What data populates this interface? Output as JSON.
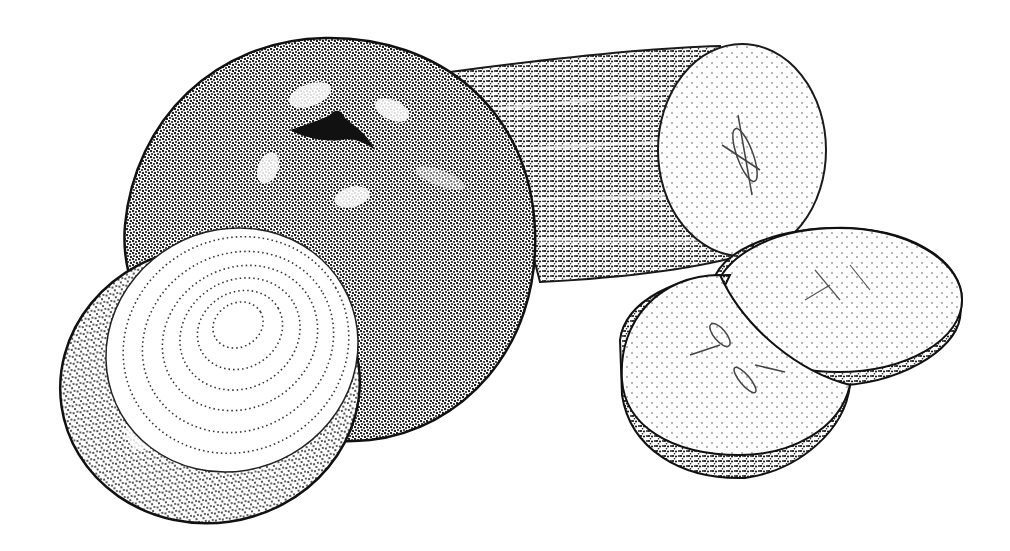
{
  "image": {
    "kind": "stippled pen-and-ink illustration",
    "background": "#ffffff",
    "ink": "#1a1a1a",
    "subjects": [
      "tomato",
      "onion-half",
      "cucumber",
      "cucumber-slice",
      "cucumber-slice"
    ]
  },
  "objects": {
    "tomato": {
      "cx": 330,
      "cy": 245,
      "rx": 205,
      "ry": 195
    },
    "cucumber_body": {
      "x": 450,
      "y": 50,
      "w": 300,
      "h": 235
    },
    "cucumber_end": {
      "cx": 742,
      "cy": 150,
      "rx": 84,
      "ry": 106
    },
    "onion_outer": {
      "cx": 210,
      "cy": 385,
      "rx": 155,
      "ry": 140
    },
    "onion_face": {
      "cx": 232,
      "cy": 350,
      "rx": 128,
      "ry": 120
    },
    "slice_back": {
      "cx": 838,
      "cy": 305,
      "rx": 126,
      "ry": 78
    },
    "slice_front": {
      "cx": 732,
      "cy": 375,
      "rx": 116,
      "ry": 100
    }
  }
}
